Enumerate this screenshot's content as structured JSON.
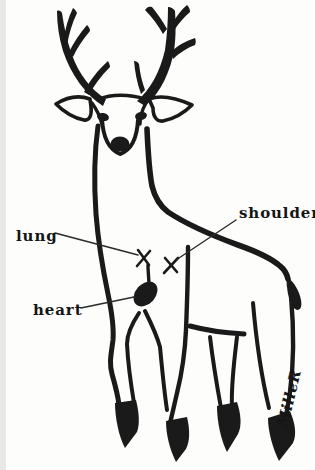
{
  "canvas": {
    "ink_color": "#1a1a1a",
    "paper_color": "#fdfdfb"
  },
  "illustration": {
    "subject": "hand-drawn ink illustration of a standing buck deer with antlers, labeled vital zones",
    "labels": {
      "lung": "lung",
      "shoulder": "shoulder",
      "heart": "heart"
    },
    "markers": [
      {
        "target": "lung",
        "glyph": "x"
      },
      {
        "target": "shoulder",
        "glyph": "x"
      },
      {
        "target": "heart",
        "glyph": "filled-heart-silhouette"
      }
    ],
    "signature": "MilleR"
  }
}
